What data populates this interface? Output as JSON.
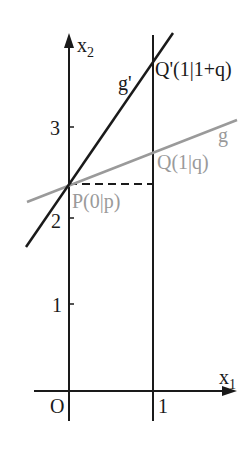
{
  "diagram": {
    "axes": {
      "x_label": "x",
      "x_sub": "1",
      "y_label": "x",
      "y_sub": "2",
      "origin_label": "O",
      "x_ticks": [
        {
          "value": 1,
          "label": "1"
        }
      ],
      "y_ticks": [
        {
          "value": 1,
          "label": "1"
        },
        {
          "value": 2,
          "label": "2"
        },
        {
          "value": 3,
          "label": "3"
        }
      ]
    },
    "lines": {
      "g": {
        "label": "g",
        "color": "#9a9a9a"
      },
      "g_prime": {
        "label": "g'",
        "color": "#1a1a1a"
      },
      "vertical_x1": {
        "label": "x1 = 1",
        "color": "#1a1a1a"
      }
    },
    "points": {
      "P": {
        "label": "P(0|p)",
        "color": "#9a9a9a"
      },
      "Q": {
        "label": "Q(1|q)",
        "color": "#9a9a9a"
      },
      "Q_prime": {
        "label": "Q'(1|1+q)",
        "color": "#1a1a1a"
      }
    },
    "colors": {
      "black": "#1a1a1a",
      "gray": "#9a9a9a",
      "background": "#ffffff"
    }
  }
}
